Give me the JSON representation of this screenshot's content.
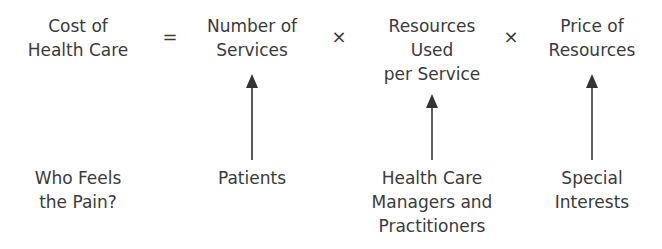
{
  "equation": {
    "lhs": {
      "lines": [
        "Cost of",
        "Health Care"
      ]
    },
    "equals": "=",
    "times": "×",
    "factors": [
      {
        "lines": [
          "Number of",
          "Services"
        ]
      },
      {
        "lines": [
          "Resources",
          "Used",
          "per Service"
        ]
      },
      {
        "lines": [
          "Price of",
          "Resources"
        ]
      }
    ]
  },
  "pain": {
    "question": {
      "lines": [
        "Who Feels",
        "the Pain?"
      ]
    },
    "groups": [
      {
        "lines": [
          "Patients"
        ]
      },
      {
        "lines": [
          "Health Care",
          "Managers and",
          "Practitioners"
        ]
      },
      {
        "lines": [
          "Special",
          "Interests"
        ]
      }
    ]
  },
  "colors": {
    "text": "#3a3a3a",
    "arrow": "#333333",
    "background": "#ffffff"
  }
}
